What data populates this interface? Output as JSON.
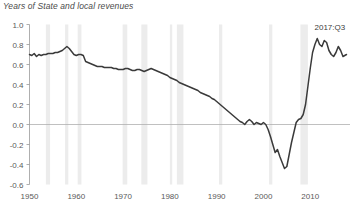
{
  "chart_data": {
    "type": "line",
    "title": "Years of State and local revenues",
    "xlabel": "",
    "ylabel": "",
    "xlim": [
      1950,
      2018.5
    ],
    "ylim": [
      -0.6,
      1.0
    ],
    "grid": false,
    "legend": "none",
    "yticks": [
      1.0,
      0.8,
      0.6,
      0.4,
      0.2,
      0.0,
      -0.2,
      -0.4,
      -0.6
    ],
    "ytick_labels": [
      "1.0",
      "0.8",
      "0.6",
      "0.4",
      "0.2",
      "0.0",
      "-0.2",
      "-0.4",
      "-0.6"
    ],
    "xticks": [
      1950,
      1960,
      1970,
      1980,
      1990,
      2000,
      2010
    ],
    "xtick_labels": [
      "1950",
      "1960",
      "1970",
      "1980",
      "1990",
      "2000",
      "2010"
    ],
    "zero_line": 0.0,
    "line_color": "#3a3a3a",
    "recession_band_color": "#ececec",
    "axis_color": "#9a9a9a",
    "annotations": [
      {
        "text": "2017:Q3",
        "x": 2014.2,
        "y": 0.95
      }
    ],
    "recessions": [
      {
        "start": 1953.5,
        "end": 1954.4
      },
      {
        "start": 1957.6,
        "end": 1958.3
      },
      {
        "start": 1960.3,
        "end": 1961.1
      },
      {
        "start": 1969.9,
        "end": 1970.9
      },
      {
        "start": 1973.9,
        "end": 1975.2
      },
      {
        "start": 1980.0,
        "end": 1980.5
      },
      {
        "start": 1981.5,
        "end": 1982.9
      },
      {
        "start": 1990.5,
        "end": 1991.2
      },
      {
        "start": 2001.2,
        "end": 2001.9
      },
      {
        "start": 2007.9,
        "end": 2009.5
      }
    ],
    "x": [
      1950.0,
      1950.5,
      1951.0,
      1951.5,
      1952.0,
      1952.5,
      1953.0,
      1953.5,
      1954.0,
      1954.5,
      1955.0,
      1955.5,
      1956.0,
      1956.5,
      1957.0,
      1957.5,
      1958.0,
      1958.5,
      1959.0,
      1959.5,
      1960.0,
      1960.5,
      1961.0,
      1961.5,
      1962.0,
      1962.5,
      1963.0,
      1963.5,
      1964.0,
      1964.5,
      1965.0,
      1965.5,
      1966.0,
      1966.5,
      1967.0,
      1967.5,
      1968.0,
      1968.5,
      1969.0,
      1969.5,
      1970.0,
      1970.5,
      1971.0,
      1971.5,
      1972.0,
      1972.5,
      1973.0,
      1973.5,
      1974.0,
      1974.5,
      1975.0,
      1975.5,
      1976.0,
      1976.5,
      1977.0,
      1977.5,
      1978.0,
      1978.5,
      1979.0,
      1979.5,
      1980.0,
      1980.5,
      1981.0,
      1981.5,
      1982.0,
      1982.5,
      1983.0,
      1983.5,
      1984.0,
      1984.5,
      1985.0,
      1985.5,
      1986.0,
      1986.5,
      1987.0,
      1987.5,
      1988.0,
      1988.5,
      1989.0,
      1989.5,
      1990.0,
      1990.5,
      1991.0,
      1991.5,
      1992.0,
      1992.5,
      1993.0,
      1993.5,
      1994.0,
      1994.5,
      1995.0,
      1995.5,
      1996.0,
      1996.5,
      1997.0,
      1997.5,
      1998.0,
      1998.5,
      1999.0,
      1999.5,
      2000.0,
      2000.5,
      2001.0,
      2001.5,
      2002.0,
      2002.5,
      2003.0,
      2003.5,
      2004.0,
      2004.5,
      2005.0,
      2005.5,
      2006.0,
      2006.5,
      2007.0,
      2007.5,
      2008.0,
      2008.5,
      2009.0,
      2009.5,
      2010.0,
      2010.5,
      2011.0,
      2011.5,
      2012.0,
      2012.5,
      2013.0,
      2013.5,
      2014.0,
      2014.5,
      2015.0,
      2015.5,
      2016.0,
      2016.5,
      2017.0,
      2017.75
    ],
    "y": [
      0.7,
      0.69,
      0.71,
      0.68,
      0.7,
      0.69,
      0.7,
      0.7,
      0.71,
      0.71,
      0.71,
      0.72,
      0.72,
      0.73,
      0.74,
      0.76,
      0.78,
      0.76,
      0.73,
      0.7,
      0.69,
      0.7,
      0.7,
      0.69,
      0.63,
      0.62,
      0.61,
      0.6,
      0.59,
      0.58,
      0.58,
      0.58,
      0.57,
      0.57,
      0.57,
      0.57,
      0.56,
      0.56,
      0.55,
      0.55,
      0.55,
      0.56,
      0.56,
      0.55,
      0.54,
      0.54,
      0.55,
      0.55,
      0.54,
      0.53,
      0.54,
      0.55,
      0.56,
      0.55,
      0.54,
      0.53,
      0.52,
      0.51,
      0.5,
      0.49,
      0.47,
      0.46,
      0.45,
      0.44,
      0.42,
      0.41,
      0.4,
      0.39,
      0.38,
      0.37,
      0.36,
      0.35,
      0.34,
      0.32,
      0.31,
      0.3,
      0.29,
      0.28,
      0.26,
      0.25,
      0.23,
      0.21,
      0.19,
      0.17,
      0.15,
      0.13,
      0.11,
      0.09,
      0.07,
      0.05,
      0.03,
      0.02,
      0.0,
      0.03,
      0.05,
      0.03,
      0.0,
      0.02,
      0.01,
      0.0,
      0.02,
      0.0,
      -0.05,
      -0.12,
      -0.2,
      -0.28,
      -0.25,
      -0.32,
      -0.38,
      -0.44,
      -0.42,
      -0.3,
      -0.18,
      -0.08,
      0.02,
      0.05,
      0.06,
      0.1,
      0.2,
      0.38,
      0.56,
      0.72,
      0.8,
      0.86,
      0.8,
      0.78,
      0.84,
      0.82,
      0.74,
      0.7,
      0.68,
      0.72,
      0.78,
      0.74,
      0.68,
      0.7
    ]
  }
}
